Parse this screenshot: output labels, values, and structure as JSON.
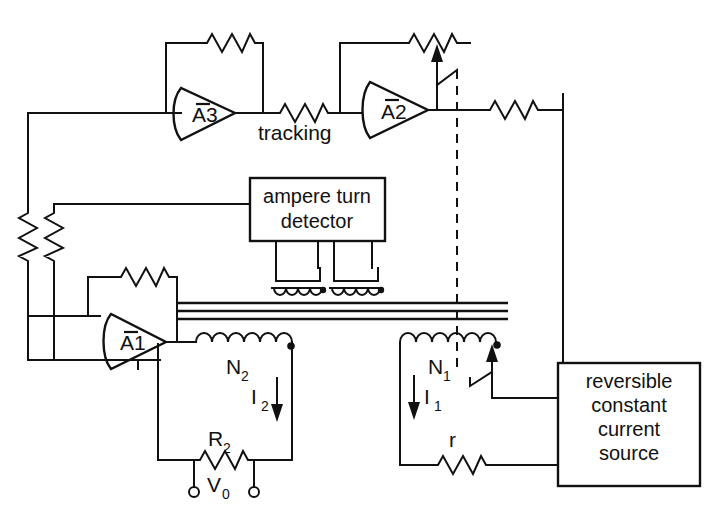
{
  "diagram": {
    "background_color": "#ffffff",
    "line_color": "#111111",
    "width": 716,
    "height": 520
  },
  "blocks": {
    "detector": {
      "line1": "ampere turn",
      "line2": "detector"
    },
    "source": {
      "line1": "reversible",
      "line2": "constant",
      "line3": "current",
      "line4": "source"
    }
  },
  "amplifiers": [
    {
      "id": "a3",
      "label": "A3",
      "inverting": true
    },
    {
      "id": "a2",
      "label": "A2",
      "inverting": true
    },
    {
      "id": "a1",
      "label": "A1",
      "inverting": true
    }
  ],
  "labels": {
    "tracking": "tracking",
    "n2": "N",
    "n2_sub": "2",
    "n1": "N",
    "n1_sub": "1",
    "i2": "I",
    "i2_sub": "2",
    "i1": "I",
    "i1_sub": "1",
    "r2": "R",
    "r2_sub": "2",
    "v0": "V",
    "v0_sub": "0",
    "r_small": "r"
  },
  "components": {
    "resistor_feedback_a3": "resistor",
    "resistor_feedback_a2_pot": "potentiometer",
    "resistor_tracking": "resistor",
    "resistor_a2_output": "resistor",
    "resistor_feedback_a1": "resistor",
    "resistor_left_outer": "resistor",
    "resistor_left_inner": "resistor",
    "resistor_r2": "resistor",
    "resistor_r": "resistor",
    "winding_n2": "coil",
    "winding_n1": "coil",
    "sense_coil_left": "current-transformer",
    "sense_coil_right": "current-transformer",
    "magnetic_core": "core-lines"
  }
}
